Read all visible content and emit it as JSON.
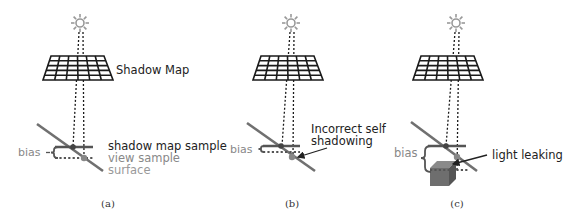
{
  "figure": {
    "panels": [
      {
        "id": "a",
        "caption": "(a)",
        "shadow_map_label": "Shadow Map",
        "bias_label": "bias",
        "shadow_map_sample_label": "shadow map sample",
        "view_sample_label": "view sample",
        "surface_label": "surface"
      },
      {
        "id": "b",
        "caption": "(b)",
        "bias_label": "bias",
        "annotation_line1": "Incorrect self",
        "annotation_line2": "shadowing"
      },
      {
        "id": "c",
        "caption": "(c)",
        "bias_label": "bias",
        "annotation": "light leaking"
      }
    ],
    "colors": {
      "grid": "#1a1a1a",
      "surface": "#707070",
      "shadow_sample_line": "#555555",
      "gray_text": "#888888",
      "dark_text": "#222222",
      "cube_front": "#6e6e6e",
      "cube_top": "#8a8a8a",
      "cube_side": "#555555",
      "sun": "#999999"
    },
    "icons": {
      "light_source": "sun-icon",
      "shadow_map": "grid-icon",
      "occluder": "cube-icon",
      "pointer": "arrow-icon"
    }
  }
}
